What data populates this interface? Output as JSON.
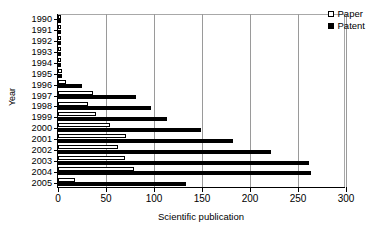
{
  "chart_data": {
    "type": "bar",
    "orientation": "horizontal",
    "title": "",
    "xlabel": "Scientific publication",
    "ylabel": "Year",
    "xlim": [
      0,
      300
    ],
    "xticks": [
      0,
      50,
      100,
      150,
      200,
      250,
      300
    ],
    "grid": "vertical",
    "legend_position": "top-right",
    "categories": [
      "1990",
      "1991",
      "1992",
      "1993",
      "1994",
      "1995",
      "1996",
      "1997",
      "1998",
      "1999",
      "2000",
      "2001",
      "2002",
      "2003",
      "2004",
      "2005"
    ],
    "series": [
      {
        "name": "Paper",
        "color": "#ffffff",
        "values": [
          2,
          2,
          2,
          3,
          2,
          4,
          8,
          36,
          31,
          40,
          54,
          71,
          62,
          70,
          79,
          18
        ]
      },
      {
        "name": "Patent",
        "color": "#000000",
        "values": [
          2,
          2,
          2,
          3,
          2,
          4,
          25,
          81,
          97,
          114,
          149,
          182,
          222,
          261,
          264,
          133
        ]
      }
    ]
  },
  "legend": {
    "items": [
      {
        "label": "Paper",
        "swatch": "open-square-icon"
      },
      {
        "label": "Patent",
        "swatch": "filled-square-icon"
      }
    ]
  },
  "axes": {
    "x_title": "Scientific publication",
    "y_title": "Year"
  }
}
